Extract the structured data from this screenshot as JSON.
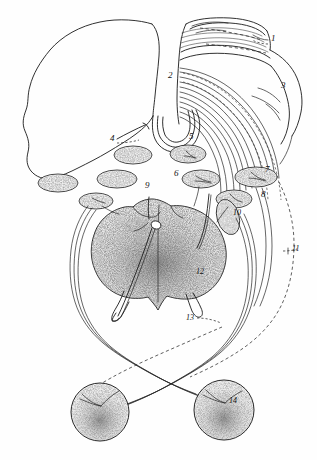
{
  "figure": {
    "style": "engraved ink line drawing with stippled shading",
    "background_color": "#fefefe",
    "ink_color": "#1a1a1a",
    "width": 317,
    "height": 460
  },
  "labels": [
    {
      "id": "1",
      "text": "1",
      "x": 271,
      "y": 41,
      "leader": true
    },
    {
      "id": "2",
      "text": "2",
      "x": 168,
      "y": 78,
      "leader": false
    },
    {
      "id": "3",
      "text": "3",
      "x": 281,
      "y": 88,
      "leader": false
    },
    {
      "id": "4",
      "text": "4",
      "x": 110,
      "y": 141,
      "leader": true
    },
    {
      "id": "5",
      "text": "5",
      "x": 189,
      "y": 139,
      "leader": false
    },
    {
      "id": "6",
      "text": "6",
      "x": 174,
      "y": 176,
      "leader": false
    },
    {
      "id": "7",
      "text": "7",
      "x": 265,
      "y": 172,
      "leader": false
    },
    {
      "id": "8",
      "text": "8",
      "x": 261,
      "y": 197,
      "leader": false
    },
    {
      "id": "9",
      "text": "9",
      "x": 145,
      "y": 188,
      "leader": false
    },
    {
      "id": "10",
      "text": "10",
      "x": 233,
      "y": 215,
      "leader": false
    },
    {
      "id": "11",
      "text": "11",
      "x": 287,
      "y": 251,
      "leader": true
    },
    {
      "id": "12",
      "text": "12",
      "x": 196,
      "y": 274,
      "leader": false
    },
    {
      "id": "13",
      "text": "13",
      "x": 188,
      "y": 317,
      "leader": true
    },
    {
      "id": "14",
      "text": "14",
      "x": 229,
      "y": 403,
      "leader": false
    }
  ],
  "structures": {
    "left_organ": {
      "name": "large lobed organ outline",
      "shaded": false
    },
    "upper_tube": {
      "name": "banded cylindrical tube",
      "shaded": false
    },
    "right_organ": {
      "name": "rounded organ at right",
      "shaded": false
    },
    "central_organ": {
      "name": "bilobed stippled central gland",
      "shaded": true
    },
    "ganglia": {
      "name": "stippled oval ganglia",
      "count": 9,
      "shaded": true
    },
    "lower_spheres": {
      "name": "paired stippled spherical organs",
      "count": 2,
      "shaded": true
    },
    "nerve_bundles": {
      "name": "curved nerve fiber bundles"
    },
    "dashed_paths": {
      "name": "dashed nerve pathways"
    }
  }
}
